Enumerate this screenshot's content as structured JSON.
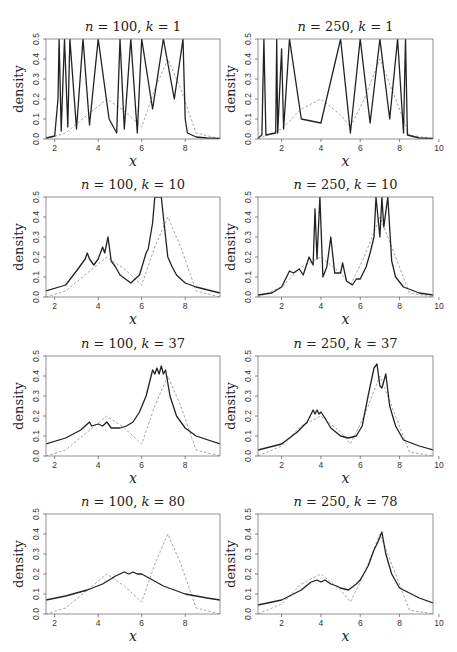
{
  "figure": {
    "ylabel": "density",
    "xlabel": "x",
    "colors": {
      "estimate": "#222222",
      "true_density": "#999999",
      "frame": "#777777"
    }
  },
  "panels": [
    {
      "title": "n = 100, k = 1",
      "n": "100",
      "k": "1"
    },
    {
      "title": "n = 250, k = 1",
      "n": "250",
      "k": "1"
    },
    {
      "title": "n = 100, k = 10",
      "n": "100",
      "k": "10"
    },
    {
      "title": "n = 250, k = 10",
      "n": "250",
      "k": "10"
    },
    {
      "title": "n = 100, k = 37",
      "n": "100",
      "k": "37"
    },
    {
      "title": "n = 250, k = 37",
      "n": "250",
      "k": "37"
    },
    {
      "title": "n = 100, k = 80",
      "n": "100",
      "k": "80"
    },
    {
      "title": "n = 250, k = 78",
      "n": "250",
      "k": "78"
    }
  ],
  "chart_data": [
    {
      "type": "line",
      "title": "n = 100, k = 1",
      "xlabel": "x",
      "ylabel": "density",
      "xlim": [
        1.6,
        9.6
      ],
      "ylim": [
        0,
        0.5
      ],
      "xticks": [
        2,
        4,
        6,
        8
      ],
      "yticks": [
        0.0,
        0.1,
        0.2,
        0.3,
        0.4,
        0.5
      ],
      "series": [
        {
          "name": "estimate",
          "style": "solid",
          "x": [
            1.6,
            2.0,
            2.15,
            2.2,
            2.3,
            2.45,
            2.6,
            2.7,
            3.0,
            3.3,
            3.6,
            4.0,
            4.5,
            4.85,
            5.0,
            5.2,
            5.5,
            5.8,
            6.0,
            6.5,
            7.0,
            7.5,
            7.9,
            8.0,
            8.1,
            8.5,
            9.0,
            9.6
          ],
          "y": [
            0.005,
            0.015,
            0.2,
            0.5,
            0.04,
            0.5,
            0.06,
            0.5,
            0.05,
            0.5,
            0.07,
            0.5,
            0.1,
            0.03,
            0.5,
            0.05,
            0.5,
            0.03,
            0.5,
            0.15,
            0.5,
            0.2,
            0.5,
            0.1,
            0.03,
            0.01,
            0.005,
            0.003
          ]
        },
        {
          "name": "true density",
          "style": "dashed",
          "x": [
            1.6,
            2.5,
            3.5,
            4.4,
            5.2,
            6.0,
            6.6,
            7.2,
            7.8,
            8.5,
            9.6
          ],
          "y": [
            0.0,
            0.03,
            0.12,
            0.2,
            0.14,
            0.06,
            0.25,
            0.4,
            0.25,
            0.03,
            0.0
          ]
        }
      ]
    },
    {
      "type": "line",
      "title": "n = 250, k = 1",
      "xlabel": "x",
      "ylabel": "density",
      "xlim": [
        0.8,
        9.7
      ],
      "ylim": [
        0,
        0.5
      ],
      "xticks": [
        2,
        4,
        6,
        8,
        10
      ],
      "yticks": [
        0.0,
        0.1,
        0.2,
        0.3,
        0.4,
        0.5
      ],
      "series": [
        {
          "name": "estimate",
          "style": "solid",
          "x": [
            0.8,
            1.0,
            1.1,
            1.2,
            1.7,
            1.75,
            1.8,
            2.0,
            2.1,
            2.4,
            3.0,
            4.0,
            5.0,
            5.5,
            6.0,
            6.5,
            7.0,
            7.5,
            7.9,
            8.2,
            8.3,
            8.4,
            9.0,
            9.7
          ],
          "y": [
            0.005,
            0.02,
            0.5,
            0.02,
            0.03,
            0.5,
            0.03,
            0.45,
            0.05,
            0.5,
            0.1,
            0.08,
            0.5,
            0.03,
            0.5,
            0.08,
            0.5,
            0.1,
            0.5,
            0.03,
            0.5,
            0.02,
            0.005,
            0.003
          ]
        },
        {
          "name": "true density",
          "style": "dashed",
          "x": [
            0.8,
            2.0,
            3.0,
            4.0,
            5.0,
            5.5,
            6.2,
            7.0,
            7.8,
            8.5,
            9.7
          ],
          "y": [
            0.0,
            0.05,
            0.15,
            0.2,
            0.12,
            0.06,
            0.2,
            0.4,
            0.2,
            0.02,
            0.0
          ]
        }
      ]
    },
    {
      "type": "line",
      "title": "n = 100, k = 10",
      "xlabel": "x",
      "ylabel": "density",
      "xlim": [
        1.6,
        9.6
      ],
      "ylim": [
        0,
        0.5
      ],
      "xticks": [
        2,
        4,
        6,
        8
      ],
      "yticks": [
        0.0,
        0.1,
        0.2,
        0.3,
        0.4,
        0.5
      ],
      "series": [
        {
          "name": "estimate",
          "style": "solid",
          "x": [
            1.6,
            2.5,
            3.0,
            3.2,
            3.4,
            3.5,
            3.6,
            3.8,
            4.0,
            4.2,
            4.3,
            4.45,
            4.6,
            4.8,
            5.0,
            5.5,
            5.9,
            6.2,
            6.3,
            6.5,
            6.6,
            6.7,
            6.9,
            7.0,
            7.2,
            7.4,
            7.6,
            8.0,
            8.5,
            9.6
          ],
          "y": [
            0.03,
            0.06,
            0.13,
            0.16,
            0.19,
            0.22,
            0.19,
            0.16,
            0.19,
            0.25,
            0.22,
            0.3,
            0.18,
            0.15,
            0.11,
            0.07,
            0.11,
            0.22,
            0.24,
            0.37,
            0.5,
            0.5,
            0.5,
            0.4,
            0.2,
            0.15,
            0.11,
            0.07,
            0.05,
            0.02
          ]
        },
        {
          "name": "true density",
          "style": "dashed",
          "x": [
            1.6,
            2.5,
            3.5,
            4.4,
            5.2,
            6.0,
            6.6,
            7.2,
            7.8,
            8.5,
            9.6
          ],
          "y": [
            0.0,
            0.03,
            0.12,
            0.2,
            0.14,
            0.06,
            0.25,
            0.4,
            0.25,
            0.03,
            0.0
          ]
        }
      ]
    },
    {
      "type": "line",
      "title": "n = 250, k = 10",
      "xlabel": "x",
      "ylabel": "density",
      "xlim": [
        0.8,
        9.7
      ],
      "ylim": [
        0,
        0.5
      ],
      "xticks": [
        2,
        4,
        6,
        8,
        10
      ],
      "yticks": [
        0.0,
        0.1,
        0.2,
        0.3,
        0.4,
        0.5
      ],
      "series": [
        {
          "name": "estimate",
          "style": "solid",
          "x": [
            0.8,
            1.5,
            2.0,
            2.4,
            2.6,
            2.9,
            3.1,
            3.4,
            3.6,
            3.7,
            3.8,
            3.95,
            4.1,
            4.3,
            4.5,
            4.7,
            5.0,
            5.1,
            5.3,
            5.6,
            5.8,
            6.0,
            6.3,
            6.5,
            6.7,
            6.8,
            7.0,
            7.1,
            7.2,
            7.4,
            7.6,
            7.8,
            8.2,
            9.0,
            9.7
          ],
          "y": [
            0.01,
            0.02,
            0.05,
            0.13,
            0.12,
            0.14,
            0.11,
            0.2,
            0.16,
            0.44,
            0.19,
            0.5,
            0.1,
            0.15,
            0.3,
            0.12,
            0.12,
            0.17,
            0.08,
            0.06,
            0.09,
            0.09,
            0.15,
            0.22,
            0.3,
            0.5,
            0.3,
            0.5,
            0.35,
            0.5,
            0.18,
            0.1,
            0.05,
            0.02,
            0.01
          ]
        },
        {
          "name": "true density",
          "style": "dashed",
          "x": [
            0.8,
            2.0,
            3.0,
            4.0,
            5.0,
            5.5,
            6.2,
            7.0,
            7.8,
            8.5,
            9.7
          ],
          "y": [
            0.0,
            0.05,
            0.15,
            0.2,
            0.12,
            0.06,
            0.2,
            0.4,
            0.2,
            0.02,
            0.0
          ]
        }
      ]
    },
    {
      "type": "line",
      "title": "n = 100, k = 37",
      "xlabel": "x",
      "ylabel": "density",
      "xlim": [
        1.6,
        9.6
      ],
      "ylim": [
        0,
        0.5
      ],
      "xticks": [
        2,
        4,
        6,
        8
      ],
      "yticks": [
        0.0,
        0.1,
        0.2,
        0.3,
        0.4,
        0.5
      ],
      "series": [
        {
          "name": "estimate",
          "style": "solid",
          "x": [
            1.6,
            2.5,
            3.2,
            3.6,
            3.7,
            4.0,
            4.2,
            4.4,
            4.6,
            5.0,
            5.3,
            5.6,
            5.9,
            6.2,
            6.5,
            6.6,
            6.7,
            6.8,
            6.9,
            7.0,
            7.1,
            7.3,
            7.6,
            8.0,
            8.5,
            9.6
          ],
          "y": [
            0.06,
            0.09,
            0.13,
            0.17,
            0.15,
            0.16,
            0.15,
            0.17,
            0.14,
            0.14,
            0.15,
            0.17,
            0.22,
            0.3,
            0.43,
            0.41,
            0.44,
            0.41,
            0.45,
            0.41,
            0.43,
            0.3,
            0.2,
            0.14,
            0.1,
            0.06
          ]
        },
        {
          "name": "true density",
          "style": "dashed",
          "x": [
            1.6,
            2.5,
            3.5,
            4.4,
            5.2,
            6.0,
            6.6,
            7.2,
            7.8,
            8.5,
            9.6
          ],
          "y": [
            0.0,
            0.03,
            0.12,
            0.2,
            0.14,
            0.06,
            0.25,
            0.4,
            0.25,
            0.03,
            0.0
          ]
        }
      ]
    },
    {
      "type": "line",
      "title": "n = 250, k = 37",
      "xlabel": "x",
      "ylabel": "density",
      "xlim": [
        0.8,
        9.7
      ],
      "ylim": [
        0,
        0.5
      ],
      "xticks": [
        2,
        4,
        6,
        8,
        10
      ],
      "yticks": [
        0.0,
        0.1,
        0.2,
        0.3,
        0.4,
        0.5
      ],
      "series": [
        {
          "name": "estimate",
          "style": "solid",
          "x": [
            0.8,
            2.0,
            2.8,
            3.3,
            3.6,
            3.7,
            3.8,
            3.9,
            4.0,
            4.2,
            4.5,
            5.0,
            5.4,
            5.8,
            6.1,
            6.4,
            6.7,
            6.85,
            7.0,
            7.1,
            7.3,
            7.5,
            7.8,
            8.2,
            9.0,
            9.7
          ],
          "y": [
            0.03,
            0.06,
            0.12,
            0.17,
            0.23,
            0.21,
            0.23,
            0.21,
            0.22,
            0.19,
            0.14,
            0.1,
            0.09,
            0.1,
            0.15,
            0.3,
            0.44,
            0.46,
            0.35,
            0.34,
            0.41,
            0.25,
            0.15,
            0.08,
            0.05,
            0.03
          ]
        },
        {
          "name": "true density",
          "style": "dashed",
          "x": [
            0.8,
            2.0,
            3.0,
            4.0,
            5.0,
            5.5,
            6.2,
            7.0,
            7.8,
            8.5,
            9.7
          ],
          "y": [
            0.0,
            0.05,
            0.15,
            0.2,
            0.12,
            0.06,
            0.2,
            0.4,
            0.2,
            0.02,
            0.0
          ]
        }
      ]
    },
    {
      "type": "line",
      "title": "n = 100, k = 80",
      "xlabel": "x",
      "ylabel": "density",
      "xlim": [
        1.6,
        9.6
      ],
      "ylim": [
        0,
        0.5
      ],
      "xticks": [
        2,
        4,
        6,
        8
      ],
      "yticks": [
        0.0,
        0.1,
        0.2,
        0.3,
        0.4,
        0.5
      ],
      "series": [
        {
          "name": "estimate",
          "style": "solid",
          "x": [
            1.6,
            2.5,
            3.5,
            4.2,
            4.8,
            5.2,
            5.4,
            5.6,
            5.8,
            6.0,
            6.5,
            7.0,
            8.0,
            9.0,
            9.6
          ],
          "y": [
            0.07,
            0.09,
            0.12,
            0.15,
            0.19,
            0.21,
            0.2,
            0.21,
            0.2,
            0.2,
            0.17,
            0.14,
            0.1,
            0.08,
            0.07
          ]
        },
        {
          "name": "true density",
          "style": "dashed",
          "x": [
            1.6,
            2.5,
            3.5,
            4.4,
            5.2,
            6.0,
            6.6,
            7.2,
            7.8,
            8.5,
            9.6
          ],
          "y": [
            0.0,
            0.03,
            0.12,
            0.2,
            0.14,
            0.06,
            0.25,
            0.4,
            0.25,
            0.03,
            0.0
          ]
        }
      ]
    },
    {
      "type": "line",
      "title": "n = 250, k = 78",
      "xlabel": "x",
      "ylabel": "density",
      "xlim": [
        0.8,
        9.7
      ],
      "ylim": [
        0,
        0.5
      ],
      "xticks": [
        2,
        4,
        6,
        8,
        10
      ],
      "yticks": [
        0.0,
        0.1,
        0.2,
        0.3,
        0.4,
        0.5
      ],
      "series": [
        {
          "name": "estimate",
          "style": "solid",
          "x": [
            0.8,
            2.0,
            3.0,
            3.5,
            3.8,
            4.0,
            4.2,
            4.5,
            4.8,
            5.0,
            5.4,
            5.8,
            6.0,
            6.4,
            6.7,
            6.9,
            7.1,
            7.3,
            7.6,
            8.0,
            9.0,
            9.7
          ],
          "y": [
            0.045,
            0.07,
            0.12,
            0.16,
            0.17,
            0.16,
            0.17,
            0.15,
            0.14,
            0.13,
            0.12,
            0.15,
            0.17,
            0.24,
            0.32,
            0.36,
            0.41,
            0.3,
            0.2,
            0.13,
            0.08,
            0.055
          ]
        },
        {
          "name": "true density",
          "style": "dashed",
          "x": [
            0.8,
            2.0,
            3.0,
            4.0,
            5.0,
            5.5,
            6.2,
            7.0,
            7.8,
            8.5,
            9.7
          ],
          "y": [
            0.0,
            0.05,
            0.15,
            0.2,
            0.12,
            0.06,
            0.2,
            0.4,
            0.2,
            0.02,
            0.0
          ]
        }
      ]
    }
  ]
}
